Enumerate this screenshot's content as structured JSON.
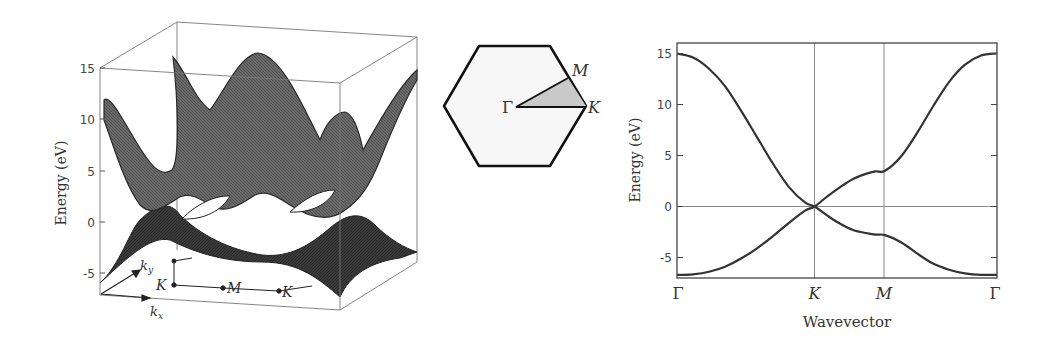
{
  "chart_data": [
    {
      "type": "surface3d",
      "title": "",
      "zlabel": "Energy (eV)",
      "zticks": [
        15,
        10,
        5,
        0,
        -5
      ],
      "zlim": [
        -7,
        16
      ],
      "xlabel": "k_x",
      "ylabel": "k_y",
      "path_labels": [
        "K",
        "M",
        "K"
      ],
      "description": "Two tight-binding band surfaces of graphene over the k_x-k_y plane, touching at K points (Dirac cones); upper band peaks near 15 eV, lower band minimum near -6.7 eV"
    },
    {
      "type": "diagram",
      "title": "Hexagonal Brillouin zone",
      "points": [
        "Γ",
        "M",
        "K"
      ],
      "shaded_region": "irreducible wedge Γ-M-K"
    },
    {
      "type": "line",
      "title": "",
      "xlabel": "Wavevector",
      "ylabel": "Energy (eV)",
      "xtick_labels": [
        "Γ",
        "K",
        "M",
        "Γ"
      ],
      "xtick_positions": [
        0,
        0.43,
        0.65,
        1.0
      ],
      "yticks": [
        15,
        10,
        5,
        0,
        -5
      ],
      "ylim": [
        -7,
        16
      ],
      "grid": "vertical lines at K and M, horizontal line at 0",
      "x": [
        0,
        0.05,
        0.1,
        0.15,
        0.2,
        0.25,
        0.3,
        0.35,
        0.4,
        0.43,
        0.47,
        0.51,
        0.55,
        0.59,
        0.62,
        0.65,
        0.7,
        0.75,
        0.8,
        0.85,
        0.9,
        0.95,
        1.0
      ],
      "series": [
        {
          "name": "upper band",
          "values": [
            15.0,
            14.6,
            13.5,
            11.8,
            9.4,
            6.8,
            4.2,
            1.9,
            0.4,
            0.0,
            -0.9,
            -1.7,
            -2.3,
            -2.6,
            -2.75,
            -2.8,
            -3.5,
            -4.6,
            -5.6,
            -6.2,
            -6.55,
            -6.7,
            -6.7
          ]
        },
        {
          "name": "lower band",
          "values": [
            -6.7,
            -6.65,
            -6.4,
            -5.9,
            -5.1,
            -4.1,
            -2.9,
            -1.6,
            -0.4,
            0.0,
            1.0,
            1.9,
            2.7,
            3.2,
            3.45,
            3.5,
            4.9,
            7.2,
            9.8,
            12.2,
            13.9,
            14.8,
            15.0
          ]
        }
      ]
    }
  ],
  "panel3d": {
    "zlabel": "Energy (eV)",
    "zticks": [
      "15",
      "10",
      "5",
      "0",
      "-5"
    ],
    "kx": "k",
    "kx_sub": "x",
    "ky": "k",
    "ky_sub": "y",
    "pathK1": "K",
    "pathM": "M",
    "pathK2": "K"
  },
  "bz": {
    "gamma": "Γ",
    "m": "M",
    "k": "K"
  },
  "bands": {
    "ylabel": "Energy (eV)",
    "xlabel": "Wavevector",
    "yticks": [
      "15",
      "10",
      "5",
      "0",
      "-5"
    ],
    "xticks": [
      "Γ",
      "K",
      "M",
      "Γ"
    ]
  }
}
